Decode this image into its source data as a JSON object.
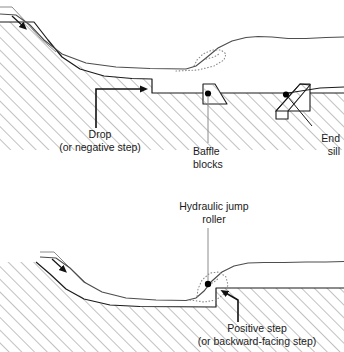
{
  "figure": {
    "type": "engineering-cross-section-diagram",
    "colors": {
      "outline": "#1a1a1a",
      "hatch": "#8c8c8c",
      "water_surface": "#4d4d4d",
      "roller_dotted": "#8c8c8c",
      "marker_dot": "#000000",
      "background": "#ffffff"
    },
    "panels": [
      {
        "name": "upper-panel",
        "subject": "Stilling basin with drop, baffle blocks and end sill",
        "labels": [
          {
            "name": "drop-label",
            "lines": [
              "Drop",
              "(or negative step)"
            ],
            "align": "center",
            "x": 22,
            "y": 128,
            "w": 156
          },
          {
            "name": "baffle-blocks-label",
            "lines": [
              "Baffle",
              "blocks"
            ],
            "align": "left",
            "x": 193,
            "y": 145,
            "w": 70
          },
          {
            "name": "end-sill-label",
            "lines": [
              "End",
              "sill"
            ],
            "align": "right",
            "x": 286,
            "y": 132,
            "w": 54
          }
        ],
        "features": [
          "approach-channel",
          "flow-direction-arrow",
          "negative-step-drop",
          "baffle-block",
          "end-sill",
          "hydraulic-jump-roller",
          "hatched-bed"
        ]
      },
      {
        "name": "lower-panel",
        "subject": "Hydraulic jump over a positive backward-facing step",
        "labels": [
          {
            "name": "hydraulic-jump-roller-label",
            "lines": [
              "Hydraulic jump",
              "roller"
            ],
            "align": "center",
            "x": 152,
            "y": 200,
            "w": 124
          },
          {
            "name": "positive-step-label",
            "lines": [
              "Positive step",
              "(or backward-facing step)"
            ],
            "align": "center",
            "x": 172,
            "y": 322,
            "w": 170
          }
        ],
        "features": [
          "approach-channel",
          "flow-direction-arrow",
          "hydraulic-jump-roller",
          "positive-step",
          "hatched-bed"
        ]
      }
    ]
  }
}
